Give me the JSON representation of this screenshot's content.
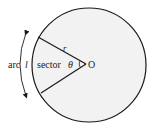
{
  "diagram": {
    "labels": {
      "arc": "arc",
      "arc_var": "l",
      "sector": "sector",
      "radius": "r",
      "angle": "θ",
      "center": "O"
    },
    "colors": {
      "circle_fill": "#f2f2f2",
      "stroke": "#1a1a1a",
      "text": "#222222"
    }
  }
}
